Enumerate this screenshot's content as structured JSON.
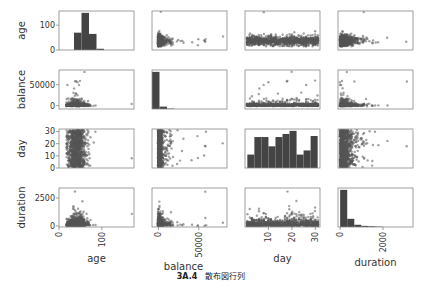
{
  "chart_data": {
    "type": "scatter_matrix",
    "variables": [
      "age",
      "balance",
      "day",
      "duration"
    ],
    "axes": {
      "age": {
        "range": [
          0,
          175
        ],
        "ticks": [
          0,
          100
        ]
      },
      "balance": {
        "range": [
          -8000,
          85000
        ],
        "ticks": [
          0,
          50000
        ]
      },
      "day": {
        "range": [
          0,
          32
        ],
        "ticks": [
          10,
          20,
          30
        ],
        "y_ticks": [
          0,
          10,
          20,
          30
        ]
      },
      "duration": {
        "range": [
          -100,
          3400
        ],
        "ticks": [
          0,
          2000
        ],
        "y_ticks": [
          0,
          2500
        ]
      }
    },
    "diagonal_histograms": {
      "age": {
        "bin_edges": [
          0,
          17.5,
          35,
          52.5,
          70,
          87.5,
          105,
          122.5,
          140,
          157.5,
          175
        ],
        "counts": [
          0,
          0,
          70,
          150,
          65,
          5,
          0,
          0,
          0,
          0,
          0
        ],
        "y_ticks": [
          0,
          100
        ]
      },
      "balance": {
        "bin_edges": [
          -8000,
          1300,
          10600,
          19900,
          29200,
          38500,
          47800,
          57100,
          66400,
          75700,
          85000
        ],
        "counts": [
          95,
          6,
          1,
          0,
          0,
          0,
          0,
          0,
          0,
          0,
          0
        ],
        "y_ticks": [
          0,
          50000
        ]
      },
      "day": {
        "bin_edges": [
          1,
          4,
          7,
          10,
          13,
          16,
          19,
          22,
          25,
          28,
          31
        ],
        "counts": [
          13,
          30,
          30,
          21,
          30,
          33,
          36,
          13,
          17,
          31
        ]
      },
      "duration": {
        "bin_edges": [
          0,
          330,
          660,
          990,
          1320,
          1650,
          1980,
          2310,
          2640,
          2970,
          3300
        ],
        "counts": [
          100,
          22,
          6,
          3,
          2,
          1,
          0,
          0,
          0,
          0
        ]
      }
    },
    "caption": {
      "number": "3A.4",
      "text": "散布図行列"
    },
    "title": "",
    "legend": "none",
    "grid": false
  },
  "labels": {
    "caption_number": "3A.4",
    "caption_text": "散布図行列"
  },
  "colors": {
    "points": "#555555",
    "bars": "#444444",
    "frame": "#888888",
    "text": "#333333"
  }
}
